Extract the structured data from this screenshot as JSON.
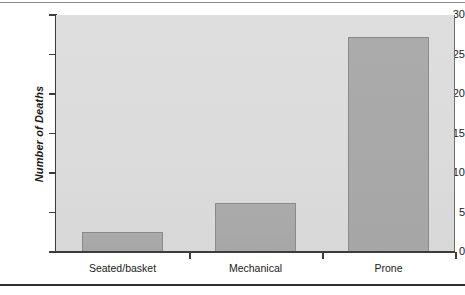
{
  "chart_data": {
    "type": "bar",
    "title": "",
    "xlabel": "",
    "ylabel": "Number of Deaths",
    "categories": [
      "Seated/basket",
      "Mechanical",
      "Prone"
    ],
    "values": [
      2.5,
      6.2,
      27.2
    ],
    "ylim": [
      0,
      30
    ],
    "yticks": [
      0,
      5,
      10,
      15,
      20,
      25,
      30
    ],
    "ytick_labels": [
      "0",
      "5",
      "10",
      "15",
      "20",
      "25",
      "30"
    ],
    "grid": false,
    "legend": null,
    "series": [
      {
        "name": "Number of Deaths",
        "values": [
          2.5,
          6.2,
          27.2
        ]
      }
    ],
    "colors": {
      "bar_fill": "#a8a8a8",
      "bar_edge": "#8a8a8a",
      "plot_background": "#dcdcdc",
      "axis": "#3c3c3c",
      "text": "#1a1a1a",
      "rule": "#2e2e2e"
    }
  }
}
